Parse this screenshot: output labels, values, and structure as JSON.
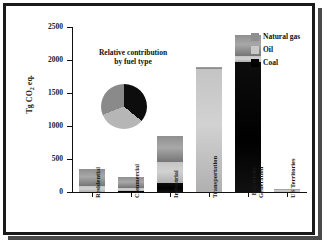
{
  "chart_data": {
    "type": "bar",
    "title": "",
    "xlabel": "",
    "ylabel": "Tg CO2 eq.",
    "ylabel_main": "Tg CO",
    "ylabel_sub": "2",
    "ylabel_tail": " eq.",
    "ylim": [
      0,
      2500
    ],
    "yticks": [
      0,
      500,
      1000,
      1500,
      2000,
      2500
    ],
    "ytick_labels": [
      "0",
      "500",
      "1000",
      "1500",
      "2000",
      "2500"
    ],
    "grid": false,
    "stacked": true,
    "legend_position": "top-right",
    "categories": [
      "Residential",
      "Commercial",
      "Industrial",
      "Transportation",
      "Electricity Generation",
      "US Territories"
    ],
    "series": [
      {
        "name": "Coal",
        "color": "#000000",
        "values": [
          0,
          5,
          130,
          0,
          1975,
          0
        ]
      },
      {
        "name": "Oil",
        "color": "#c8c8c8",
        "values": [
          95,
          40,
          325,
          1860,
          90,
          38
        ]
      },
      {
        "name": "Natural gas",
        "color": "#8f8f8f",
        "values": [
          255,
          175,
          390,
          40,
          315,
          2
        ]
      }
    ],
    "totals": [
      350,
      220,
      845,
      1900,
      2380,
      40
    ]
  },
  "inset": {
    "title_line1": "Relative contribution",
    "title_line2": "by fuel type",
    "type": "pie",
    "labels": [
      "Coal",
      "Oil",
      "Natural gas"
    ],
    "values": [
      36,
      33,
      31
    ],
    "colors": [
      "#0d0d0d",
      "#b6b6b6",
      "#8a8a8a"
    ]
  },
  "legend": {
    "items": [
      {
        "label": "Natural gas",
        "color": "#8f8f8f"
      },
      {
        "label": "Oil",
        "color": "#c8c8c8"
      },
      {
        "label": "Coal",
        "color": "#000000"
      }
    ]
  },
  "xlabels": [
    {
      "text": "Residential",
      "lines": [
        "Residential"
      ]
    },
    {
      "text": "Commercial",
      "lines": [
        "Commercial"
      ]
    },
    {
      "text": "Industrial",
      "lines": [
        "Industrial"
      ]
    },
    {
      "text": "Transportation",
      "lines": [
        "Transportation"
      ]
    },
    {
      "text": "Electricity Generation",
      "lines": [
        "Electricity",
        "Generation"
      ]
    },
    {
      "text": "US Territories",
      "lines": [
        "US Territories"
      ]
    }
  ]
}
